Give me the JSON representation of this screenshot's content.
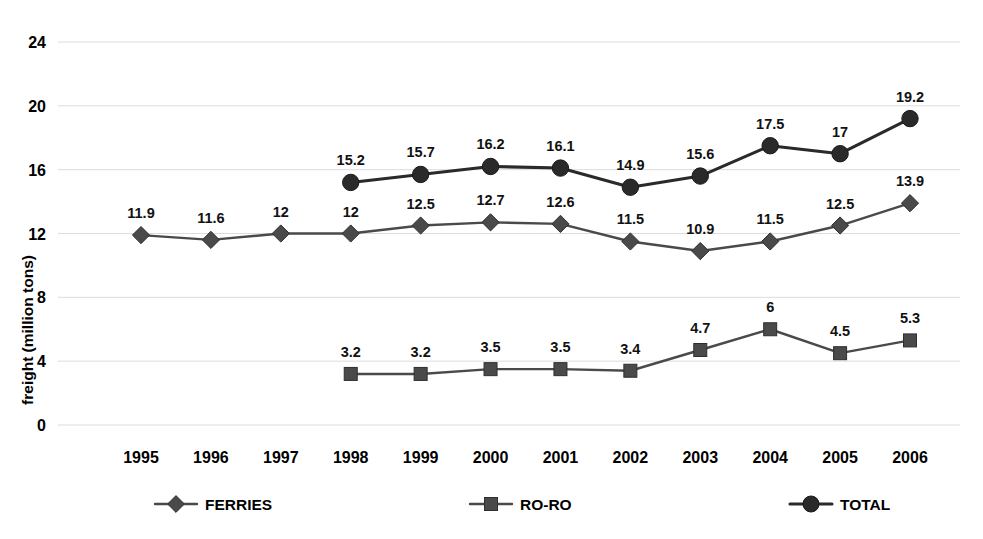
{
  "chart_data": {
    "type": "line",
    "title": "",
    "subtitle": "",
    "xlabel": "",
    "ylabel": "freight (million tons)",
    "categories": [
      "1995",
      "1996",
      "1997",
      "1998",
      "1999",
      "2000",
      "2001",
      "2002",
      "2003",
      "2004",
      "2005",
      "2006"
    ],
    "ylim": [
      0,
      24
    ],
    "yticks": [
      "0",
      "4",
      "8",
      "12",
      "16",
      "20",
      "24"
    ],
    "ytick_values": [
      0,
      4,
      8,
      12,
      16,
      20,
      24
    ],
    "grid": true,
    "legend_position": "bottom",
    "series": [
      {
        "name": "FERRIES",
        "marker": "diamond",
        "color": "#4a4a4a",
        "values": [
          11.9,
          11.6,
          12,
          12,
          12.5,
          12.7,
          12.6,
          11.5,
          10.9,
          11.5,
          12.5,
          13.9
        ],
        "labels": [
          "11.9",
          "11.6",
          "12",
          "12",
          "12.5",
          "12.7",
          "12.6",
          "11.5",
          "10.9",
          "11.5",
          "12.5",
          "13.9"
        ]
      },
      {
        "name": "RO-RO",
        "marker": "square",
        "color": "#4a4a4a",
        "values": [
          null,
          null,
          null,
          3.2,
          3.2,
          3.5,
          3.5,
          3.4,
          4.7,
          6,
          4.5,
          5.3
        ],
        "labels": [
          null,
          null,
          null,
          "3.2",
          "3.2",
          "3.5",
          "3.5",
          "3.4",
          "4.7",
          "6",
          "4.5",
          "5.3"
        ]
      },
      {
        "name": "TOTAL",
        "marker": "circle",
        "color": "#2a2a2a",
        "values": [
          null,
          null,
          null,
          15.2,
          15.7,
          16.2,
          16.1,
          14.9,
          15.6,
          17.5,
          17,
          19.2
        ],
        "labels": [
          null,
          null,
          null,
          "15.2",
          "15.7",
          "16.2",
          "16.1",
          "14.9",
          "15.6",
          "17.5",
          "17",
          "19.2"
        ]
      }
    ]
  },
  "legend": {
    "items": [
      {
        "label": "FERRIES",
        "marker": "diamond-marker-icon"
      },
      {
        "label": "RO-RO",
        "marker": "square-marker-icon"
      },
      {
        "label": "TOTAL",
        "marker": "circle-marker-icon"
      }
    ]
  },
  "colors": {
    "background": "#ffffff",
    "grid": "#dcdcdc",
    "total_series": "#2a2a2a",
    "ferries_series": "#4a4a4a",
    "roro_series": "#4a4a4a",
    "text": "#000000"
  }
}
